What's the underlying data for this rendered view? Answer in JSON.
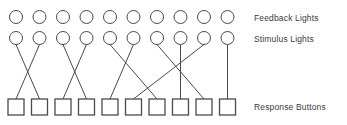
{
  "diagram": {
    "columns": 10,
    "stroke_color": "#4a4a4a",
    "background_color": "#ffffff",
    "rows": [
      {
        "id": "feedback_lights",
        "label": "Feedback Lights",
        "shape": "circle",
        "count": 10,
        "cy": 17,
        "radius": 6.5
      },
      {
        "id": "stimulus_lights",
        "label": "Stimulus Lights",
        "shape": "circle",
        "count": 10,
        "cy": 38,
        "radius": 6.5
      },
      {
        "id": "response_buttons",
        "label": "Response Buttons",
        "shape": "square",
        "count": 10,
        "cy": 107,
        "size": 16
      }
    ],
    "column_centers": [
      16,
      39.5,
      63,
      86.5,
      110,
      133.5,
      157,
      180.5,
      204,
      227.5
    ],
    "connections": [
      {
        "from_stimulus": 1,
        "to_button": 2
      },
      {
        "from_stimulus": 2,
        "to_button": 1
      },
      {
        "from_stimulus": 3,
        "to_button": 4
      },
      {
        "from_stimulus": 4,
        "to_button": 3
      },
      {
        "from_stimulus": 5,
        "to_button": 7
      },
      {
        "from_stimulus": 6,
        "to_button": 5
      },
      {
        "from_stimulus": 7,
        "to_button": 9
      },
      {
        "from_stimulus": 8,
        "to_button": 8
      },
      {
        "from_stimulus": 9,
        "to_button": 6
      },
      {
        "from_stimulus": 10,
        "to_button": 10
      }
    ]
  }
}
